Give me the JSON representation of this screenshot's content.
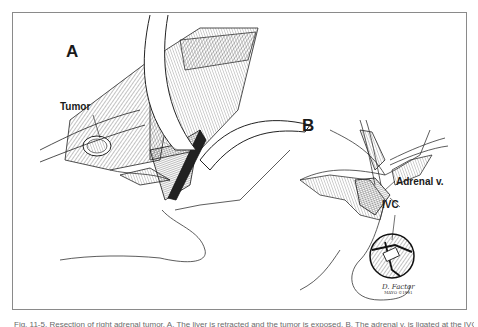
{
  "figure": {
    "panels": [
      {
        "label": "A",
        "annotations": [
          "Tumor"
        ]
      },
      {
        "label": "B",
        "annotations": [
          "Adrenal v.",
          "IVC"
        ]
      }
    ],
    "signature": {
      "name": "D. Factor",
      "sub": "MAYO ©1991"
    },
    "inset": "magnified-circular-view",
    "colors": {
      "frame": "#8a8a8a",
      "ink": "#1a1a1a",
      "caption": "#6a6a6a"
    }
  },
  "caption": {
    "text": "Fig. 11-5. Resection of right adrenal tumor. A, The liver is retracted and the tumor is exposed. B, The adrenal v. is ligated at the IVC."
  }
}
